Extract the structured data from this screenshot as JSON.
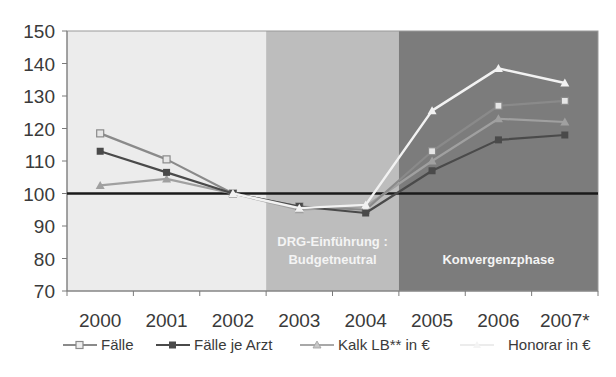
{
  "chart_data": {
    "type": "line",
    "title": "",
    "xlabel": "",
    "ylabel": "",
    "categories": [
      "2000",
      "2001",
      "2002",
      "2003",
      "2004",
      "2005",
      "2006",
      "2007*"
    ],
    "ylim": [
      70,
      150
    ],
    "yticks": [
      70,
      80,
      90,
      100,
      110,
      120,
      130,
      140,
      150
    ],
    "reference_line": 100,
    "grid": false,
    "legend_position": "bottom",
    "series": [
      {
        "name": "Fälle",
        "color": "#8a8a8a",
        "marker": "square-open",
        "values": [
          118.5,
          110.5,
          100,
          96,
          95,
          113,
          127,
          128.5
        ]
      },
      {
        "name": "Fälle je Arzt",
        "color": "#4a4a4a",
        "marker": "square-filled",
        "values": [
          113,
          106.5,
          100,
          96,
          94,
          107,
          116.5,
          118
        ]
      },
      {
        "name": "Kalk LB** in €",
        "color": "#a0a0a0",
        "marker": "triangle",
        "values": [
          102.5,
          104.5,
          100,
          95,
          96,
          110,
          123,
          122
        ]
      },
      {
        "name": "Honorar in €",
        "color": "#f2f2f2",
        "marker": "triangle",
        "values": [
          null,
          null,
          100,
          95.5,
          96.5,
          125.5,
          138.5,
          134
        ]
      }
    ],
    "regions": [
      {
        "from": "2000",
        "to": "2002",
        "label_lines": [],
        "color": "#ececec"
      },
      {
        "from": "2003",
        "to": "2004",
        "label_lines": [
          "DRG-Einführung :",
          "Budgetneutral"
        ],
        "color": "#bdbdbd"
      },
      {
        "from": "2005",
        "to": "2007*",
        "label_lines": [
          "Konvergenzphase"
        ],
        "color": "#7c7c7c"
      }
    ]
  },
  "legend": {
    "items": [
      "Fälle",
      "Fälle je Arzt",
      "Kalk LB** in €",
      "Honorar in €"
    ]
  }
}
